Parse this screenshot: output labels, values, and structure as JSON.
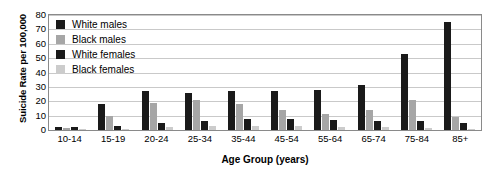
{
  "chart_data": {
    "type": "bar",
    "title": "",
    "xlabel": "Age Group (years)",
    "ylabel": "Suicide Rate per 100,000",
    "categories": [
      "10-14",
      "15-19",
      "20-24",
      "25-34",
      "35-44",
      "45-54",
      "55-64",
      "65-74",
      "75-84",
      "85+"
    ],
    "ylim": [
      0,
      80
    ],
    "yticks": [
      80,
      70,
      60,
      50,
      40,
      30,
      20,
      10,
      0
    ],
    "grid": true,
    "legend_position": "top-left",
    "series": [
      {
        "name": "White males",
        "color": "#1a1a1a",
        "values": [
          2,
          18,
          27,
          26,
          27,
          27,
          28,
          31,
          53,
          75
        ]
      },
      {
        "name": "Black males",
        "color": "#a6a6a6",
        "values": [
          1.5,
          10,
          19,
          21,
          18,
          14,
          11,
          14,
          21,
          9
        ]
      },
      {
        "name": "White females",
        "color": "#1a1a1a",
        "values": [
          2,
          3,
          5,
          6,
          8,
          8,
          7,
          6,
          6,
          5
        ]
      },
      {
        "name": "Black females",
        "color": "#cccccc",
        "values": [
          0.5,
          1,
          2,
          2.5,
          3,
          3,
          2,
          2,
          1.5,
          1
        ]
      }
    ]
  }
}
